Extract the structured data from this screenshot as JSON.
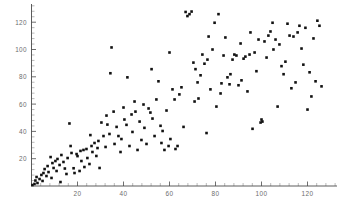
{
  "figure": {
    "background_color": "#ffffff",
    "point_color": "#111111",
    "axis_color": "#4a4a4a",
    "label_color": "#6d6d6d"
  },
  "axes": {
    "x_ticks": [
      "20",
      "40",
      "60",
      "80",
      "100",
      "120"
    ],
    "y_ticks": [
      "20",
      "40",
      "60",
      "80",
      "100",
      "120"
    ],
    "x_tick_values": [
      20,
      40,
      60,
      80,
      100,
      120
    ],
    "y_tick_values": [
      20,
      40,
      60,
      80,
      100,
      120
    ],
    "x_minor_step": 4,
    "y_minor_step": 4
  },
  "chart_data": {
    "type": "scatter",
    "title": "",
    "xlabel": "",
    "ylabel": "",
    "xlim": [
      0,
      133
    ],
    "ylim": [
      0,
      132
    ],
    "grid": false,
    "legend": null,
    "marker": "square",
    "marker_size": 2.6,
    "series": [
      {
        "name": "points",
        "color": "#111111",
        "points": [
          [
            0.4,
            0.7
          ],
          [
            1.3,
            1.5
          ],
          [
            1.7,
            4.0
          ],
          [
            2.2,
            6.6
          ],
          [
            2.6,
            2.2
          ],
          [
            3.5,
            5.1
          ],
          [
            4.3,
            8.1
          ],
          [
            4.8,
            3.7
          ],
          [
            5.2,
            9.5
          ],
          [
            5.7,
            12.4
          ],
          [
            6.5,
            7.3
          ],
          [
            7.0,
            14.6
          ],
          [
            7.4,
            10.2
          ],
          [
            8.3,
            21.2
          ],
          [
            8.7,
            5.9
          ],
          [
            9.1,
            16.8
          ],
          [
            9.6,
            13.2
          ],
          [
            10.4,
            18.3
          ],
          [
            10.9,
            11.0
          ],
          [
            11.3,
            19.8
          ],
          [
            12.2,
            15.4
          ],
          [
            12.6,
            2.9
          ],
          [
            13.0,
            22.7
          ],
          [
            13.9,
            17.6
          ],
          [
            14.5,
            12.8
          ],
          [
            15.2,
            8.8
          ],
          [
            15.7,
            20.5
          ],
          [
            16.5,
            45.8
          ],
          [
            17.0,
            29.3
          ],
          [
            17.4,
            24.2
          ],
          [
            18.3,
            13.0
          ],
          [
            18.7,
            9.5
          ],
          [
            19.6,
            23.4
          ],
          [
            20.0,
            21.9
          ],
          [
            20.9,
            11.0
          ],
          [
            21.3,
            25.7
          ],
          [
            21.7,
            18.3
          ],
          [
            22.6,
            26.4
          ],
          [
            23.0,
            13.9
          ],
          [
            23.9,
            27.1
          ],
          [
            24.3,
            20.5
          ],
          [
            25.2,
            16.1
          ],
          [
            25.6,
            37.3
          ],
          [
            26.1,
            29.3
          ],
          [
            26.5,
            24.9
          ],
          [
            27.4,
            31.5
          ],
          [
            28.2,
            22.0
          ],
          [
            28.7,
            27.8
          ],
          [
            29.1,
            33.0
          ],
          [
            29.6,
            13.2
          ],
          [
            30.4,
            46.5
          ],
          [
            31.3,
            36.6
          ],
          [
            32.2,
            28.6
          ],
          [
            32.6,
            51.6
          ],
          [
            33.0,
            45.0
          ],
          [
            33.9,
            38.1
          ],
          [
            34.3,
            82.6
          ],
          [
            34.8,
            101.5
          ],
          [
            35.7,
            54.5
          ],
          [
            36.1,
            30.8
          ],
          [
            37.0,
            43.3
          ],
          [
            37.8,
            36.6
          ],
          [
            38.7,
            24.9
          ],
          [
            39.1,
            34.4
          ],
          [
            40.0,
            57.5
          ],
          [
            40.4,
            48.7
          ],
          [
            41.3,
            44.8
          ],
          [
            41.7,
            79.6
          ],
          [
            42.6,
            29.3
          ],
          [
            43.5,
            52.4
          ],
          [
            43.9,
            39.6
          ],
          [
            44.8,
            61.9
          ],
          [
            45.2,
            54.5
          ],
          [
            46.1,
            26.4
          ],
          [
            47.0,
            47.2
          ],
          [
            47.8,
            33.7
          ],
          [
            48.7,
            59.7
          ],
          [
            49.1,
            42.6
          ],
          [
            50.0,
            30.8
          ],
          [
            50.9,
            56.8
          ],
          [
            51.7,
            53.8
          ],
          [
            52.2,
            85.6
          ],
          [
            52.6,
            49.4
          ],
          [
            53.5,
            36.6
          ],
          [
            54.3,
            63.4
          ],
          [
            55.2,
            76.7
          ],
          [
            56.1,
            44.1
          ],
          [
            56.5,
            31.5
          ],
          [
            57.0,
            40.3
          ],
          [
            57.8,
            26.4
          ],
          [
            58.7,
            55.3
          ],
          [
            59.6,
            29.3
          ],
          [
            60.0,
            97.8
          ],
          [
            60.4,
            34.4
          ],
          [
            61.3,
            70.8
          ],
          [
            62.2,
            63.4
          ],
          [
            62.6,
            27.1
          ],
          [
            63.5,
            29.3
          ],
          [
            64.3,
            67.1
          ],
          [
            65.2,
            72.3
          ],
          [
            66.1,
            43.3
          ],
          [
            67.0,
            127.5
          ],
          [
            67.8,
            124.5
          ],
          [
            68.7,
            125.9
          ],
          [
            69.6,
            127.8
          ],
          [
            70.4,
            90.4
          ],
          [
            70.9,
            61.9
          ],
          [
            71.3,
            85.6
          ],
          [
            72.2,
            75.9
          ],
          [
            72.6,
            64.1
          ],
          [
            73.5,
            81.1
          ],
          [
            74.3,
            96.3
          ],
          [
            75.2,
            89.6
          ],
          [
            76.1,
            38.8
          ],
          [
            76.5,
            92.6
          ],
          [
            77.0,
            109.5
          ],
          [
            77.8,
            70.8
          ],
          [
            78.7,
            100.0
          ],
          [
            79.6,
            119.6
          ],
          [
            80.4,
            58.2
          ],
          [
            81.3,
            125.9
          ],
          [
            82.2,
            67.8
          ],
          [
            82.6,
            75.2
          ],
          [
            83.5,
            95.6
          ],
          [
            84.3,
            108.8
          ],
          [
            85.2,
            79.6
          ],
          [
            86.1,
            74.5
          ],
          [
            86.5,
            81.9
          ],
          [
            87.4,
            92.6
          ],
          [
            88.2,
            96.3
          ],
          [
            89.1,
            95.6
          ],
          [
            90.0,
            73.8
          ],
          [
            90.9,
            104.4
          ],
          [
            91.3,
            77.4
          ],
          [
            92.2,
            93.3
          ],
          [
            93.0,
            94.8
          ],
          [
            93.9,
            69.3
          ],
          [
            94.8,
            96.3
          ],
          [
            95.2,
            112.5
          ],
          [
            96.1,
            41.9
          ],
          [
            97.0,
            97.8
          ],
          [
            97.8,
            84.1
          ],
          [
            98.7,
            107.3
          ],
          [
            99.6,
            46.5
          ],
          [
            100.0,
            48.7
          ],
          [
            100.4,
            47.2
          ],
          [
            101.3,
            105.9
          ],
          [
            102.2,
            94.1
          ],
          [
            103.0,
            110.2
          ],
          [
            103.9,
            113.2
          ],
          [
            104.8,
            119.6
          ],
          [
            105.2,
            100.0
          ],
          [
            106.1,
            107.3
          ],
          [
            107.0,
            58.2
          ],
          [
            107.8,
            103.7
          ],
          [
            108.7,
            87.8
          ],
          [
            109.6,
            81.9
          ],
          [
            110.4,
            91.1
          ],
          [
            111.3,
            118.9
          ],
          [
            112.2,
            110.2
          ],
          [
            113.0,
            71.6
          ],
          [
            113.9,
            109.5
          ],
          [
            114.8,
            75.9
          ],
          [
            115.7,
            112.5
          ],
          [
            116.5,
            117.4
          ],
          [
            117.4,
            100.7
          ],
          [
            118.2,
            88.9
          ],
          [
            119.1,
            115.9
          ],
          [
            120.0,
            56.0
          ],
          [
            120.9,
            83.3
          ],
          [
            121.7,
            65.6
          ],
          [
            122.6,
            108.1
          ],
          [
            123.5,
            76.7
          ],
          [
            124.3,
            121.1
          ],
          [
            125.2,
            117.4
          ],
          [
            126.1,
            73.0
          ]
        ]
      }
    ]
  }
}
